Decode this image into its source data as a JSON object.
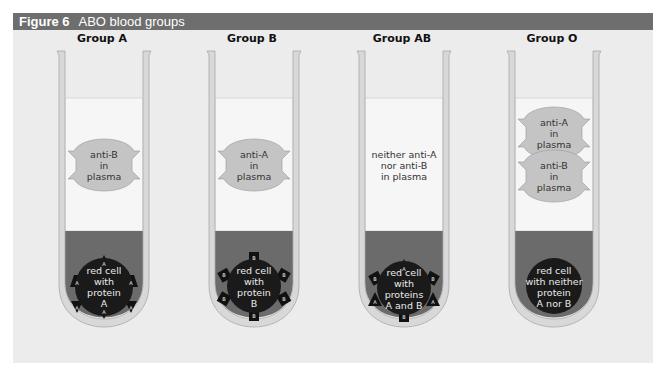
{
  "figure": {
    "number": "Figure 6",
    "title": "ABO blood groups"
  },
  "colors": {
    "title_bar": "#6e6e6e",
    "panel_bg": "#ececec",
    "plasma": "#f6f6f6",
    "blood": "#6b6b6b",
    "cell": "#1a1a1a",
    "antibody": "#c4c4c4",
    "tube_wall": "#bdbdbd"
  },
  "groups": [
    {
      "label": "Group A",
      "plasma_text": [
        "anti-B",
        "in",
        "plasma"
      ],
      "cell_text": [
        "red cell",
        "with",
        "protein",
        "A"
      ],
      "antigen_marker": "A",
      "antigen_shape": "triangle"
    },
    {
      "label": "Group B",
      "plasma_text": [
        "anti-A",
        "in",
        "plasma"
      ],
      "cell_text": [
        "red cell",
        "with",
        "protein",
        "B"
      ],
      "antigen_marker": "B",
      "antigen_shape": "square"
    },
    {
      "label": "Group AB",
      "plasma_text": [
        "neither anti-A",
        "nor anti-B",
        "in plasma"
      ],
      "cell_text": [
        "red cell",
        "with",
        "proteins",
        "A and B"
      ],
      "antigen_marker": "A,B",
      "antigen_shape": "mixed"
    },
    {
      "label": "Group O",
      "plasma_text_top": [
        "anti-A",
        "in",
        "plasma"
      ],
      "plasma_text_bottom": [
        "anti-B",
        "in",
        "plasma"
      ],
      "cell_text": [
        "red cell",
        "with neither",
        "protein",
        "A nor B"
      ],
      "antigen_marker": "",
      "antigen_shape": "none"
    }
  ]
}
